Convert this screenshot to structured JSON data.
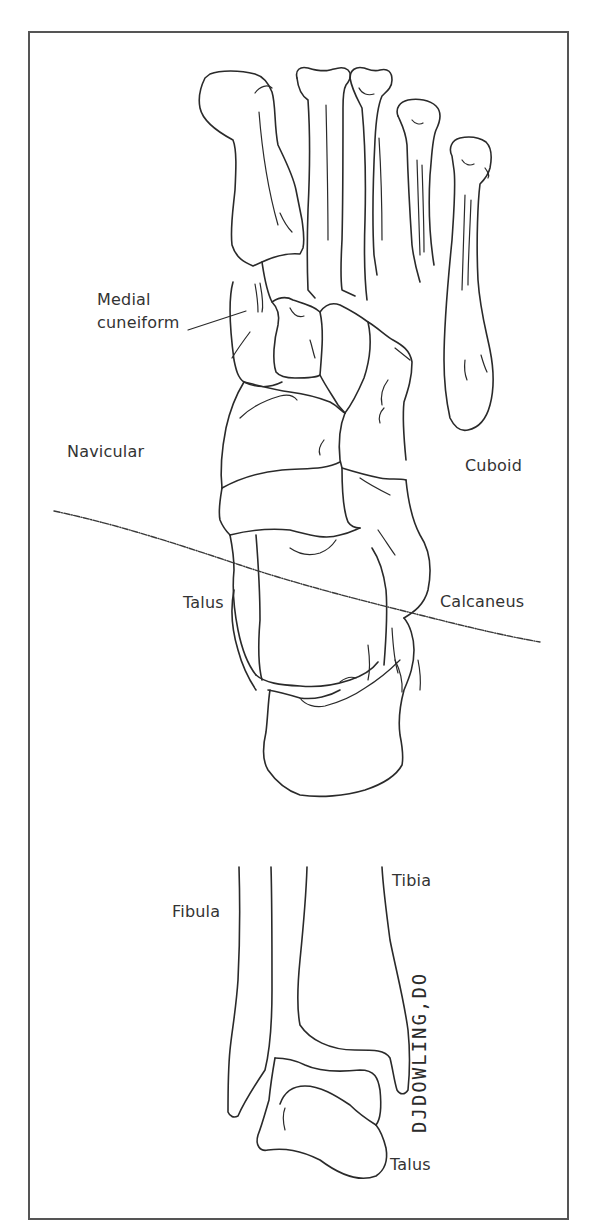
{
  "figure": {
    "type": "anatomical line drawing",
    "panels": [
      {
        "name": "foot-dorsal-view",
        "labels": {
          "medial_cuneiform_line1": "Medial",
          "medial_cuneiform_line2": "cuneiform",
          "navicular": "Navicular",
          "cuboid": "Cuboid",
          "talus": "Talus",
          "calcaneus": "Calcaneus"
        }
      },
      {
        "name": "ankle-coronal-view",
        "labels": {
          "fibula": "Fibula",
          "tibia": "Tibia",
          "talus": "Talus"
        }
      }
    ],
    "signature": "DJDOWLING,DO",
    "colors": {
      "line": "#2a2a2a",
      "text": "#333333",
      "frame": "#555555",
      "background": "#ffffff"
    }
  }
}
